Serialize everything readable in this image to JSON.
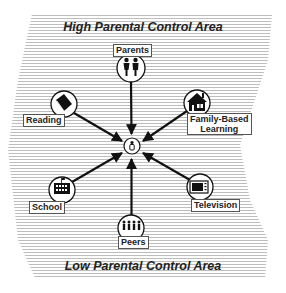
{
  "diagram": {
    "top_area_label": "High Parental Control Area",
    "bottom_area_label": "Low Parental Control Area",
    "center": {
      "icon": "child-icon",
      "x": 133,
      "y": 146
    },
    "nodes": [
      {
        "id": "parents",
        "label": "Parents",
        "icon": "parents-icon",
        "x": 131,
        "y": 68,
        "label_x": 113,
        "label_y": 44
      },
      {
        "id": "reading",
        "label": "Reading",
        "icon": "book-icon",
        "x": 64,
        "y": 104,
        "label_x": 23,
        "label_y": 114
      },
      {
        "id": "family-based-learning",
        "label_lines": [
          "Family-Based",
          "Learning"
        ],
        "icon": "house-icon",
        "x": 197,
        "y": 103,
        "label_x": 187,
        "label_y": 113
      },
      {
        "id": "school",
        "label": "School",
        "icon": "school-icon",
        "x": 62,
        "y": 190,
        "label_x": 29,
        "label_y": 201
      },
      {
        "id": "television",
        "label": "Television",
        "icon": "television-icon",
        "x": 200,
        "y": 187,
        "label_x": 191,
        "label_y": 198
      },
      {
        "id": "peers",
        "label": "Peers",
        "icon": "peers-icon",
        "x": 131,
        "y": 228,
        "label_x": 118,
        "label_y": 236
      }
    ],
    "edges": [
      {
        "from": "parents",
        "to": "center"
      },
      {
        "from": "reading",
        "to": "center"
      },
      {
        "from": "family-based-learning",
        "to": "center"
      },
      {
        "from": "school",
        "to": "center"
      },
      {
        "from": "television",
        "to": "center"
      },
      {
        "from": "peers",
        "to": "center"
      }
    ],
    "colors": {
      "stripe": "#b8b8b8",
      "line": "#111111",
      "label_border": "#555555"
    }
  }
}
